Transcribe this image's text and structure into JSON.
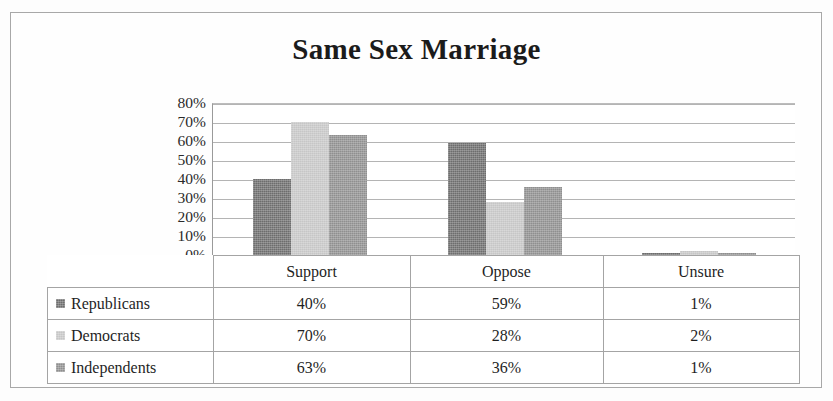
{
  "chart_data": {
    "type": "bar",
    "title": "Same Sex Marriage",
    "xlabel": "",
    "ylabel": "",
    "categories": [
      "Support",
      "Oppose",
      "Unsure"
    ],
    "series": [
      {
        "name": "Republicans",
        "values": [
          40,
          59,
          1
        ],
        "color": "#6d6d6d"
      },
      {
        "name": "Democrats",
        "values": [
          70,
          28,
          2
        ],
        "color": "#c6c6c6"
      },
      {
        "name": "Independents",
        "values": [
          63,
          36,
          1
        ],
        "color": "#8f8f8f"
      }
    ],
    "value_labels": [
      [
        "40%",
        "59%",
        "1%"
      ],
      [
        "70%",
        "28%",
        "2%"
      ],
      [
        "63%",
        "36%",
        "1%"
      ]
    ],
    "ylim": [
      0,
      80
    ],
    "y_ticks": [
      80,
      70,
      60,
      50,
      40,
      30,
      20,
      10,
      0
    ],
    "y_tick_labels": [
      "80%",
      "70%",
      "60%",
      "50%",
      "40%",
      "30%",
      "20%",
      "10%",
      "0%"
    ],
    "grid": true,
    "legend_position": "data-table-left",
    "data_table_visible": true
  },
  "table": {
    "corner_label": "",
    "column_headers": [
      "Support",
      "Oppose",
      "Unsure"
    ],
    "rows": [
      {
        "series": "Republicans",
        "cells": [
          "40%",
          "59%",
          "1%"
        ]
      },
      {
        "series": "Democrats",
        "cells": [
          "70%",
          "28%",
          "2%"
        ]
      },
      {
        "series": "Independents",
        "cells": [
          "63%",
          "36%",
          "1%"
        ]
      }
    ]
  }
}
